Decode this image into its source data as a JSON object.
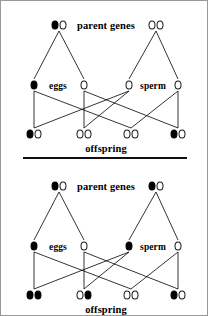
{
  "figure": {
    "border_color": "#9a9a9a",
    "background": "#ffffff",
    "ink_color": "#000000",
    "allele_filled_color": "#000000",
    "allele_open_color": "#ffffff"
  },
  "labels": {
    "parent_genes": "parent genes",
    "eggs": "eggs",
    "sperm": "sperm",
    "offspring": "offspring"
  },
  "panels": [
    {
      "id": "top",
      "name": "heterozygous-by-homozygous-recessive-cross",
      "parents": [
        {
          "name": "mother",
          "alleles": [
            "filled",
            "open"
          ],
          "x": 58,
          "y": 22
        },
        {
          "name": "father",
          "alleles": [
            "open",
            "open"
          ],
          "x": 155,
          "y": 22
        }
      ],
      "gametes": [
        {
          "name": "egg-1",
          "side": "eggs",
          "alleles": [
            "filled"
          ],
          "x": 33,
          "y": 82
        },
        {
          "name": "egg-2",
          "side": "eggs",
          "alleles": [
            "open"
          ],
          "x": 83,
          "y": 82
        },
        {
          "name": "sperm-1",
          "side": "sperm",
          "alleles": [
            "open"
          ],
          "x": 128,
          "y": 82
        },
        {
          "name": "sperm-2",
          "side": "sperm",
          "alleles": [
            "open"
          ],
          "x": 177,
          "y": 82
        }
      ],
      "offspring": [
        {
          "name": "offspring-1",
          "alleles": [
            "filled",
            "open"
          ],
          "x": 33,
          "y": 131
        },
        {
          "name": "offspring-2",
          "alleles": [
            "open",
            "open"
          ],
          "x": 83,
          "y": 131
        },
        {
          "name": "offspring-3",
          "alleles": [
            "open",
            "open"
          ],
          "x": 130,
          "y": 131
        },
        {
          "name": "offspring-4",
          "alleles": [
            "filled",
            "open"
          ],
          "x": 177,
          "y": 131
        }
      ],
      "parent_links": [
        [
          58,
          22,
          33,
          82
        ],
        [
          58,
          22,
          83,
          82
        ],
        [
          155,
          22,
          128,
          82
        ],
        [
          155,
          22,
          177,
          82
        ]
      ],
      "fertilization_links": [
        [
          33,
          82,
          33,
          131
        ],
        [
          33,
          82,
          130,
          131
        ],
        [
          83,
          82,
          83,
          131
        ],
        [
          83,
          82,
          177,
          131
        ],
        [
          128,
          82,
          33,
          131
        ],
        [
          128,
          82,
          83,
          131
        ],
        [
          177,
          82,
          130,
          131
        ],
        [
          177,
          82,
          177,
          131
        ]
      ],
      "label_positions": {
        "parent_genes": {
          "x": 105,
          "y": 22
        },
        "eggs": {
          "x": 57,
          "y": 83
        },
        "sperm": {
          "x": 152,
          "y": 83
        },
        "offspring": {
          "x": 105,
          "y": 145
        }
      }
    },
    {
      "id": "bottom",
      "name": "heterozygous-by-heterozygous-cross",
      "parents": [
        {
          "name": "mother",
          "alleles": [
            "filled",
            "open"
          ],
          "x": 58,
          "y": 22
        },
        {
          "name": "father",
          "alleles": [
            "filled",
            "open"
          ],
          "x": 155,
          "y": 22
        }
      ],
      "gametes": [
        {
          "name": "egg-1",
          "side": "eggs",
          "alleles": [
            "filled"
          ],
          "x": 33,
          "y": 82
        },
        {
          "name": "egg-2",
          "side": "eggs",
          "alleles": [
            "open"
          ],
          "x": 83,
          "y": 82
        },
        {
          "name": "sperm-1",
          "side": "sperm",
          "alleles": [
            "filled"
          ],
          "x": 128,
          "y": 82
        },
        {
          "name": "sperm-2",
          "side": "sperm",
          "alleles": [
            "open"
          ],
          "x": 177,
          "y": 82
        }
      ],
      "offspring": [
        {
          "name": "offspring-1",
          "alleles": [
            "filled",
            "filled"
          ],
          "x": 33,
          "y": 131
        },
        {
          "name": "offspring-2",
          "alleles": [
            "open",
            "filled"
          ],
          "x": 83,
          "y": 131
        },
        {
          "name": "offspring-3",
          "alleles": [
            "open",
            "open"
          ],
          "x": 130,
          "y": 131
        },
        {
          "name": "offspring-4",
          "alleles": [
            "filled",
            "open"
          ],
          "x": 177,
          "y": 131
        }
      ],
      "parent_links": [
        [
          58,
          22,
          33,
          82
        ],
        [
          58,
          22,
          83,
          82
        ],
        [
          155,
          22,
          128,
          82
        ],
        [
          155,
          22,
          177,
          82
        ]
      ],
      "fertilization_links": [
        [
          33,
          82,
          33,
          131
        ],
        [
          33,
          82,
          130,
          131
        ],
        [
          83,
          82,
          83,
          131
        ],
        [
          83,
          82,
          177,
          131
        ],
        [
          128,
          82,
          33,
          131
        ],
        [
          128,
          82,
          83,
          131
        ],
        [
          177,
          82,
          130,
          131
        ],
        [
          177,
          82,
          177,
          131
        ]
      ],
      "label_positions": {
        "parent_genes": {
          "x": 105,
          "y": 22
        },
        "eggs": {
          "x": 57,
          "y": 83
        },
        "sperm": {
          "x": 152,
          "y": 83
        },
        "offspring": {
          "x": 105,
          "y": 145
        }
      }
    }
  ]
}
